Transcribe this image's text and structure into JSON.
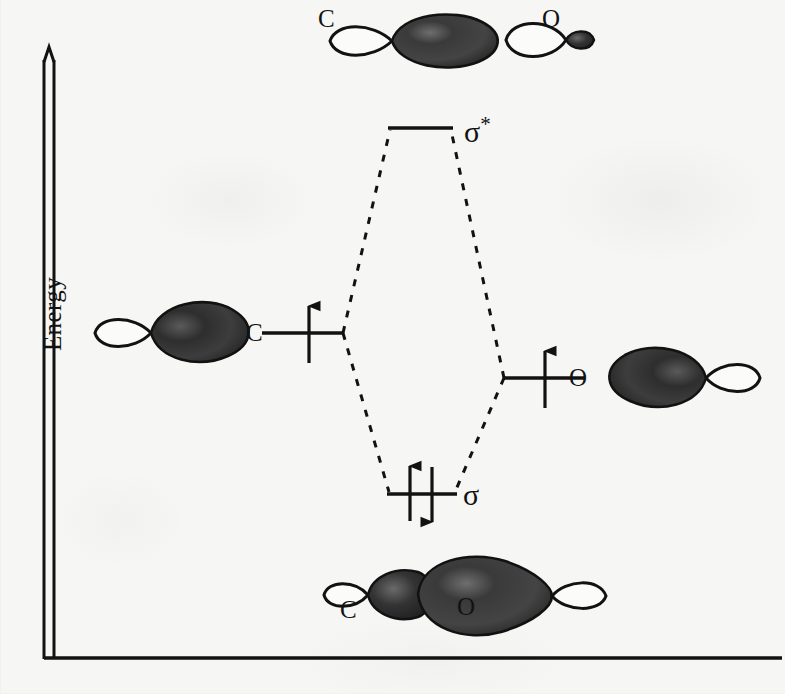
{
  "figure": {
    "type": "molecular-orbital-energy-diagram",
    "molecule": "CO",
    "axis": {
      "y_label": "Energy",
      "y_axis_has_arrowhead": true,
      "x_axis_label": ""
    },
    "atomic_orbitals": [
      {
        "id": "left-atomic-orbital",
        "atom_label": "C",
        "electrons": 1,
        "electron_spins": [
          "up"
        ],
        "level_y": 333,
        "side": "left"
      },
      {
        "id": "right-atomic-orbital",
        "atom_label": "O",
        "electrons": 1,
        "electron_spins": [
          "up"
        ],
        "level_y": 378,
        "side": "right"
      }
    ],
    "molecular_orbitals": [
      {
        "id": "antibonding",
        "label": "σ",
        "superscript": "*",
        "electrons": 0,
        "electron_spins": [],
        "level_y": 128
      },
      {
        "id": "bonding",
        "label": "σ",
        "superscript": "",
        "electrons": 2,
        "electron_spins": [
          "up",
          "down"
        ],
        "level_y": 494
      }
    ],
    "orbital_pictures": [
      {
        "id": "antibonding-mo-picture",
        "position": "top",
        "labels": [
          "C",
          "O"
        ],
        "description": "out-of-phase combination: large carbon lobe and small oxygen lobe"
      },
      {
        "id": "carbon-atomic-orbital-picture",
        "position": "left",
        "labels": [
          "C"
        ],
        "description": "carbon sp hybrid orbital, large lobe pointing right"
      },
      {
        "id": "oxygen-atomic-orbital-picture",
        "position": "right",
        "labels": [
          "O"
        ],
        "description": "oxygen sp hybrid orbital, large lobe pointing left"
      },
      {
        "id": "bonding-mo-picture",
        "position": "bottom",
        "labels": [
          "C",
          "O"
        ],
        "description": "in-phase combination: merged bonding lobes between C and O"
      }
    ],
    "colors": {
      "ink": "#121212",
      "paper": "#f6f6f4",
      "lobe_dark": "#1b1b1b",
      "lobe_light": "#ffffff"
    }
  }
}
